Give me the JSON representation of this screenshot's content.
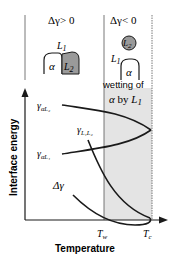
{
  "panels": {
    "left": {
      "condition": "Δγ> 0",
      "l1_label": "L",
      "l1_sub": "1",
      "alpha": "α",
      "l2_label": "L",
      "l2_sub": "2"
    },
    "right": {
      "condition": "Δγ< 0",
      "l1_label": "L",
      "l1_sub": "1",
      "alpha": "α",
      "l2_label": "L",
      "l2_sub": "2"
    }
  },
  "region": {
    "label_line1": "wetting of",
    "label_line2_alpha": "α",
    "label_line2_by": " by ",
    "label_line2_L": "L",
    "label_line2_sub": "1",
    "fill_color": "#e4e4e4"
  },
  "axes": {
    "ylabel": "Interface energy",
    "xlabel": "Temperature",
    "x_ticks": {
      "tw": "T",
      "tw_sub": "w",
      "tc": "T",
      "tc_sub": "c"
    }
  },
  "curves": {
    "gamma_aL2": {
      "symbol": "γ",
      "sub": "αL₂"
    },
    "gamma_aL1": {
      "symbol": "γ",
      "sub": "αL₁"
    },
    "gamma_L1L2": {
      "symbol": "γ",
      "sub": "L₁L₂"
    },
    "delta_gamma": {
      "symbol": "Δγ"
    }
  },
  "colors": {
    "line": "#1a1a1a",
    "l2_fill": "#9a9a9a",
    "frame": "#555555"
  }
}
